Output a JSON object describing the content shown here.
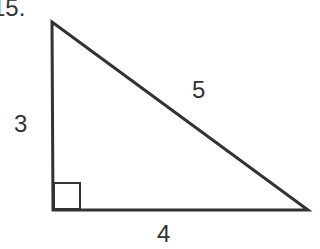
{
  "problem_number": "15.",
  "triangle": {
    "vertices": {
      "top": [
        52,
        22
      ],
      "right_angle": [
        53,
        210
      ],
      "right": [
        308,
        210
      ]
    },
    "sides": {
      "vertical_leg": "3",
      "horizontal_leg": "4",
      "hypotenuse": "5"
    },
    "right_angle_marker": true,
    "stroke_color": "#333333"
  }
}
